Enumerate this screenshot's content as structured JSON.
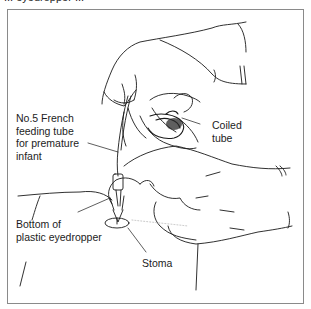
{
  "figure": {
    "cutoff_caption": "... eyedropper ...",
    "labels": {
      "feeding_tube": [
        "No.5 French",
        "feeding tube",
        "for premature",
        "infant"
      ],
      "coiled_tube": [
        "Coiled",
        "tube"
      ],
      "eyedropper": [
        "Bottom of",
        "plastic eyedropper"
      ],
      "stoma": "Stoma"
    },
    "colors": {
      "line": "#1a1a1a",
      "frame": "#8a8a8a",
      "background": "#ffffff"
    }
  }
}
